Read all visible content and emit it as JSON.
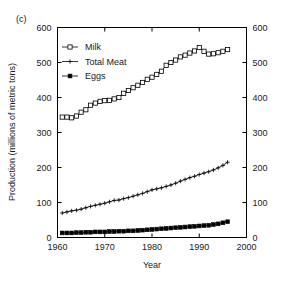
{
  "panel": {
    "label": "(c)"
  },
  "chart_data": {
    "type": "line",
    "title": "",
    "xlabel": "Year",
    "ylabel": "Production (millions of metric tons)",
    "xlim": [
      1960,
      2000
    ],
    "ylim": [
      0,
      600
    ],
    "xticks": [
      1960,
      1970,
      1980,
      1990,
      2000
    ],
    "yticks": [
      0,
      100,
      200,
      300,
      400,
      500,
      600
    ],
    "xtick_labels": [
      "1960",
      "1970",
      "1980",
      "1990",
      "2000"
    ],
    "ytick_labels": [
      "0",
      "100",
      "200",
      "300",
      "400",
      "500",
      "600"
    ],
    "right_axis_labels": [
      "0",
      "100",
      "200",
      "300",
      "400",
      "500",
      "600"
    ],
    "grid": false,
    "legend_position": "upper-left-inside",
    "x": [
      1961,
      1962,
      1963,
      1964,
      1965,
      1966,
      1967,
      1968,
      1969,
      1970,
      1971,
      1972,
      1973,
      1974,
      1975,
      1976,
      1977,
      1978,
      1979,
      1980,
      1981,
      1982,
      1983,
      1984,
      1985,
      1986,
      1987,
      1988,
      1989,
      1990,
      1991,
      1992,
      1993,
      1994,
      1995,
      1996
    ],
    "series": [
      {
        "name": "Milk",
        "marker": "open-square",
        "values": [
          344,
          344,
          342,
          347,
          358,
          365,
          378,
          384,
          389,
          391,
          392,
          396,
          400,
          412,
          420,
          428,
          435,
          443,
          452,
          458,
          466,
          475,
          492,
          500,
          507,
          516,
          521,
          527,
          533,
          543,
          532,
          524,
          525,
          528,
          532,
          537
        ]
      },
      {
        "name": "Total Meat",
        "marker": "cross",
        "values": [
          70,
          73,
          76,
          78,
          81,
          85,
          89,
          92,
          95,
          98,
          102,
          106,
          107,
          111,
          114,
          118,
          122,
          126,
          131,
          136,
          139,
          142,
          146,
          150,
          155,
          161,
          166,
          171,
          175,
          180,
          184,
          188,
          193,
          199,
          206,
          215
        ]
      },
      {
        "name": "Eggs",
        "marker": "filled-square",
        "values": [
          13,
          13,
          13,
          14,
          14,
          15,
          15,
          16,
          16,
          16,
          17,
          17,
          18,
          18,
          19,
          19,
          20,
          21,
          22,
          23,
          24,
          25,
          26,
          27,
          28,
          29,
          30,
          31,
          32,
          33,
          34,
          35,
          37,
          39,
          42,
          45
        ]
      }
    ]
  },
  "legend": {
    "entries": [
      {
        "label": "Milk"
      },
      {
        "label": "Total Meat"
      },
      {
        "label": "Eggs"
      }
    ]
  },
  "colors": {
    "foreground": "#000000",
    "background": "#ffffff"
  }
}
